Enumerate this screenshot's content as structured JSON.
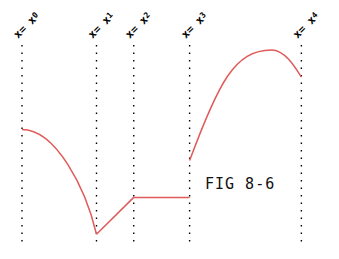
{
  "figure": {
    "caption": "FIG 8-6",
    "curve_color": "#e05a5a",
    "guide_color": "#000000"
  },
  "chart_data": {
    "type": "line",
    "title": "FIG 8-6",
    "xlabel": "",
    "ylabel": "",
    "grid": false,
    "markers": [
      {
        "id": "x0",
        "label": "x= x0",
        "sub": "0"
      },
      {
        "id": "x1",
        "label": "x= x1",
        "sub": "1"
      },
      {
        "id": "x2",
        "label": "x= x2",
        "sub": "2"
      },
      {
        "id": "x3",
        "label": "x= x3",
        "sub": "3"
      },
      {
        "id": "x4",
        "label": "x= x4",
        "sub": "4"
      }
    ],
    "x_positions": [
      0,
      1,
      1.5,
      2.25,
      3.75
    ],
    "ylim": [
      0,
      1
    ],
    "segments": [
      {
        "name": "concave-drop",
        "from": "x0",
        "to": "x1",
        "shape": "concave-down",
        "start_y": 0.58,
        "end_y": 0.04
      },
      {
        "name": "linear-rise",
        "from": "x1",
        "to": "x2",
        "shape": "linear",
        "start_y": 0.04,
        "end_y": 0.23
      },
      {
        "name": "flat",
        "from": "x2",
        "to": "x3",
        "shape": "constant",
        "start_y": 0.23,
        "end_y": 0.23
      },
      {
        "name": "hump",
        "from": "x3",
        "to": "x4",
        "shape": "concave-down",
        "start_y": 0.42,
        "peak_x": 3.35,
        "peak_y": 0.99,
        "end_y": 0.85
      }
    ],
    "discontinuities": [
      {
        "at": "x3",
        "from_y": 0.23,
        "to_y": 0.42
      }
    ]
  }
}
